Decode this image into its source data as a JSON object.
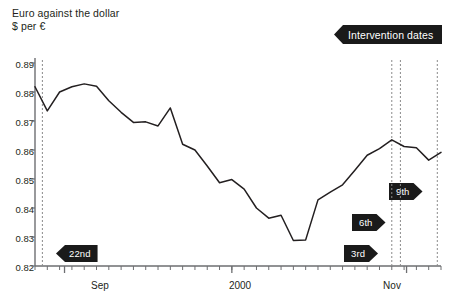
{
  "header": {
    "title": "Euro against the dollar",
    "subtitle": "$ per €",
    "legend_label": "Intervention dates",
    "legend_color": "#1a1a1a"
  },
  "axes": {
    "y_ticks": [
      "0.89",
      "0.88",
      "0.87",
      "0.86",
      "0.85",
      "0.84",
      "0.83",
      "0.82"
    ],
    "x_ticks": [
      "Sep",
      "2000",
      "Nov"
    ]
  },
  "annotations": [
    {
      "name": "intervention-22nd",
      "label": "22nd",
      "direction": "left"
    },
    {
      "name": "intervention-3rd",
      "label": "3rd",
      "direction": "right"
    },
    {
      "name": "intervention-6th",
      "label": "6th",
      "direction": "right"
    },
    {
      "name": "intervention-9th",
      "label": "9th",
      "direction": "right"
    }
  ],
  "chart_data": {
    "type": "line",
    "title": "Euro against the dollar",
    "subtitle": "$ per €",
    "xlabel": "",
    "ylabel": "$ per €",
    "ylim": [
      0.82,
      0.89
    ],
    "ytick_values": [
      0.89,
      0.88,
      0.87,
      0.86,
      0.85,
      0.84,
      0.83,
      0.82
    ],
    "xtick_labels": [
      "Sep",
      "2000",
      "Nov"
    ],
    "grid": false,
    "legend": {
      "label": "Intervention dates",
      "position": "top-right"
    },
    "series": [
      {
        "name": "$ per €",
        "color": "#231f20",
        "x": [
          0,
          1,
          2,
          3,
          4,
          5,
          6,
          7,
          8,
          9,
          10,
          11,
          12,
          13,
          14,
          15,
          16,
          17,
          18,
          19,
          20,
          21,
          22,
          23,
          24,
          25,
          26,
          27,
          28,
          29,
          30,
          31,
          32,
          33
        ],
        "values": [
          0.8818,
          0.8735,
          0.88,
          0.8818,
          0.8828,
          0.882,
          0.877,
          0.873,
          0.8695,
          0.8697,
          0.8683,
          0.8745,
          0.862,
          0.86,
          0.8545,
          0.8487,
          0.8498,
          0.8465,
          0.84,
          0.8365,
          0.8375,
          0.8288,
          0.829,
          0.8428,
          0.8455,
          0.848,
          0.853,
          0.8582,
          0.8605,
          0.8635,
          0.8612,
          0.8608,
          0.8565,
          0.8592
        ]
      }
    ],
    "intervention_lines": [
      {
        "label": "22nd",
        "x_index": 0.6
      },
      {
        "label": "3rd",
        "x_index": 29.0
      },
      {
        "label": "6th",
        "x_index": 29.7
      },
      {
        "label": "9th",
        "x_index": 32.7
      }
    ]
  }
}
